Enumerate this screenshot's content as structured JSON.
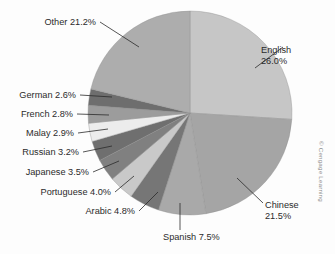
{
  "figure": {
    "credit": "© Cengage Learning",
    "background": "#fdfdfd"
  },
  "chart_data": {
    "type": "pie",
    "title": "",
    "subtitle": "",
    "xlabel": "",
    "ylabel": "",
    "legend_position": "none",
    "grid": false,
    "label_format": "{name} {value}%",
    "start_angle_deg": 0,
    "direction": "clockwise",
    "categories": [
      "English",
      "Chinese",
      "Spanish",
      "Arabic",
      "Portuguese",
      "Japanese",
      "Russian",
      "Malay",
      "French",
      "German",
      "Other"
    ],
    "values": [
      26.0,
      21.5,
      7.5,
      4.8,
      4.0,
      3.5,
      3.2,
      2.9,
      2.8,
      2.6,
      21.2
    ],
    "colors": [
      "#c6c6c6",
      "#a5a5a5",
      "#a9a9a9",
      "#767676",
      "#c9c9c9",
      "#808080",
      "#6f6f6f",
      "#ececec",
      "#9c9c9c",
      "#6e6e6e",
      "#adadad"
    ],
    "slices": [
      {
        "name": "English",
        "value": 26.0,
        "label": "English 26.0%",
        "label_line1": "English",
        "label_line2": "26.0%",
        "color": "#c6c6c6"
      },
      {
        "name": "Chinese",
        "value": 21.5,
        "label": "Chinese 21.5%",
        "label_line1": "Chinese",
        "label_line2": "21.5%",
        "color": "#a5a5a5"
      },
      {
        "name": "Spanish",
        "value": 7.5,
        "label": "Spanish 7.5%",
        "label_line1": "Spanish 7.5%",
        "label_line2": "",
        "color": "#a9a9a9"
      },
      {
        "name": "Arabic",
        "value": 4.8,
        "label": "Arabic 4.8%",
        "label_line1": "Arabic 4.8%",
        "label_line2": "",
        "color": "#767676"
      },
      {
        "name": "Portuguese",
        "value": 4.0,
        "label": "Portuguese 4.0%",
        "label_line1": "Portuguese 4.0%",
        "label_line2": "",
        "color": "#c9c9c9"
      },
      {
        "name": "Japanese",
        "value": 3.5,
        "label": "Japanese 3.5%",
        "label_line1": "Japanese 3.5%",
        "label_line2": "",
        "color": "#808080"
      },
      {
        "name": "Russian",
        "value": 3.2,
        "label": "Russian 3.2%",
        "label_line1": "Russian 3.2%",
        "label_line2": "",
        "color": "#6f6f6f"
      },
      {
        "name": "Malay",
        "value": 2.9,
        "label": "Malay 2.9%",
        "label_line1": "Malay 2.9%",
        "label_line2": "",
        "color": "#ececec"
      },
      {
        "name": "French",
        "value": 2.8,
        "label": "French 2.8%",
        "label_line1": "French 2.8%",
        "label_line2": "",
        "color": "#9c9c9c"
      },
      {
        "name": "German",
        "value": 2.6,
        "label": "German 2.6%",
        "label_line1": "German 2.6%",
        "label_line2": "",
        "color": "#6e6e6e"
      },
      {
        "name": "Other",
        "value": 21.2,
        "label": "Other 21.2%",
        "label_line1": "Other 21.2%",
        "label_line2": "",
        "color": "#adadad"
      }
    ]
  }
}
